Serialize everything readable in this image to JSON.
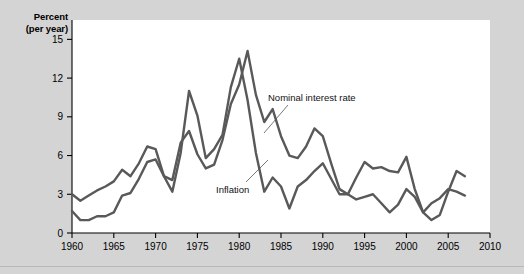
{
  "axis_title": {
    "line1": "Percent",
    "line2": "(per year)"
  },
  "labels": {
    "nominal": "Nominal interest rate",
    "inflation": "Inflation"
  },
  "colors": {
    "background": "#d4d4d4",
    "plot_background": "#ffffff",
    "line": "#595959",
    "axis": "#000000"
  },
  "chart_data": {
    "type": "line",
    "title": "",
    "xlabel": "",
    "ylabel": "Percent (per year)",
    "xlim": [
      1960,
      2010
    ],
    "ylim": [
      0,
      16.5
    ],
    "xticks": [
      1960,
      1965,
      1970,
      1975,
      1980,
      1985,
      1990,
      1995,
      2000,
      2005,
      2010
    ],
    "yticks": [
      0,
      3,
      6,
      9,
      12,
      15
    ],
    "grid": false,
    "legend": "annotated-inline",
    "x": [
      1960,
      1961,
      1962,
      1963,
      1964,
      1965,
      1966,
      1967,
      1968,
      1969,
      1970,
      1971,
      1972,
      1973,
      1974,
      1975,
      1976,
      1977,
      1978,
      1979,
      1980,
      1981,
      1982,
      1983,
      1984,
      1985,
      1986,
      1987,
      1988,
      1989,
      1990,
      1991,
      1992,
      1993,
      1994,
      1995,
      1996,
      1997,
      1998,
      1999,
      2000,
      2001,
      2002,
      2003,
      2004,
      2005,
      2006,
      2007
    ],
    "series": [
      {
        "name": "Nominal interest rate",
        "values": [
          3.0,
          2.5,
          2.9,
          3.3,
          3.6,
          4.0,
          4.9,
          4.4,
          5.4,
          6.7,
          6.5,
          4.4,
          4.1,
          7.0,
          7.9,
          6.1,
          5.0,
          5.3,
          7.2,
          10.0,
          11.5,
          14.1,
          10.7,
          8.6,
          9.6,
          7.5,
          6.0,
          5.8,
          6.7,
          8.1,
          7.5,
          5.4,
          3.4,
          3.0,
          4.3,
          5.5,
          5.0,
          5.1,
          4.8,
          4.7,
          5.9,
          3.4,
          1.6,
          1.0,
          1.4,
          3.2,
          4.8,
          4.4
        ],
        "color": "#595959"
      },
      {
        "name": "Inflation",
        "values": [
          1.7,
          1.0,
          1.0,
          1.3,
          1.3,
          1.6,
          2.9,
          3.1,
          4.2,
          5.5,
          5.7,
          4.4,
          3.2,
          6.2,
          11.0,
          9.1,
          5.8,
          6.5,
          7.6,
          11.3,
          13.5,
          10.3,
          6.2,
          3.2,
          4.3,
          3.6,
          1.9,
          3.6,
          4.1,
          4.8,
          5.4,
          4.2,
          3.0,
          3.0,
          2.6,
          2.8,
          3.0,
          2.3,
          1.6,
          2.2,
          3.4,
          2.8,
          1.6,
          2.3,
          2.7,
          3.4,
          3.2,
          2.9
        ],
        "color": "#595959"
      }
    ]
  }
}
